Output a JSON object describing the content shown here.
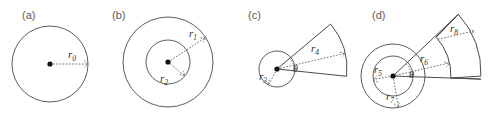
{
  "figure": {
    "background": "#ffffff",
    "stroke_color": "#5c5c5c",
    "label_color": "#5a5a5a",
    "width": 489,
    "height": 119
  },
  "panels": [
    {
      "id": "a",
      "label": "(a)",
      "description": "single circle with center dot and dashed radius",
      "center": [
        50,
        64
      ],
      "shapes": [
        {
          "kind": "circle",
          "radius": 38
        }
      ],
      "radii_labels": [
        {
          "name": "r0",
          "base": "r",
          "sub": "0",
          "value_px": 38,
          "angle_deg": 0
        }
      ],
      "angle_label": null
    },
    {
      "id": "b",
      "label": "(b)",
      "description": "two concentric circles with dashed radii to each",
      "center": [
        168,
        62
      ],
      "shapes": [
        {
          "kind": "circle",
          "radius": 45
        },
        {
          "kind": "circle",
          "radius": 22
        }
      ],
      "radii_labels": [
        {
          "name": "r1",
          "base": "r",
          "sub": "1",
          "value_px": 45,
          "angle_deg": 33
        },
        {
          "name": "r2",
          "base": "r",
          "sub": "2",
          "value_px": 22,
          "angle_deg": -40
        }
      ],
      "angle_label": null
    },
    {
      "id": "c",
      "label": "(c)",
      "description": "small circle with circular sector wedge extending to upper right",
      "center": [
        277,
        69
      ],
      "shapes": [
        {
          "kind": "circle",
          "radius": 18
        },
        {
          "kind": "sector",
          "radius": 70,
          "start_deg": -6,
          "end_deg": 40
        }
      ],
      "radii_labels": [
        {
          "name": "r3",
          "base": "r",
          "sub": "3",
          "value_px": 18,
          "angle_deg": -118
        },
        {
          "name": "r4",
          "base": "r",
          "sub": "4",
          "value_px": 70,
          "angle_deg": 13
        }
      ],
      "angle_label": {
        "name": "theta",
        "glyph": "θ",
        "between_deg": [
          -6,
          40
        ]
      }
    },
    {
      "id": "d",
      "label": "(d)",
      "description": "two concentric circles plus a two-ring annular sector to upper right",
      "center": [
        393,
        76
      ],
      "shapes": [
        {
          "kind": "circle",
          "radius": 20
        },
        {
          "kind": "circle",
          "radius": 32
        },
        {
          "kind": "annular-sector",
          "inner_radius": 58,
          "outer_radius": 88,
          "start_deg": -2,
          "end_deg": 42
        }
      ],
      "radii_labels": [
        {
          "name": "r5",
          "base": "r",
          "sub": "5",
          "value_px": 20,
          "angle_deg": -170
        },
        {
          "name": "r6",
          "base": "r",
          "sub": "6",
          "value_px": 58,
          "angle_deg": 13
        },
        {
          "name": "r7",
          "base": "r",
          "sub": "7",
          "value_px": 32,
          "angle_deg": -100
        },
        {
          "name": "r8",
          "base": "r",
          "sub": "8",
          "value_px": 88,
          "angle_deg": 30
        }
      ],
      "angle_label": {
        "name": "theta",
        "glyph": "θ",
        "between_deg": [
          -2,
          42
        ]
      }
    }
  ]
}
